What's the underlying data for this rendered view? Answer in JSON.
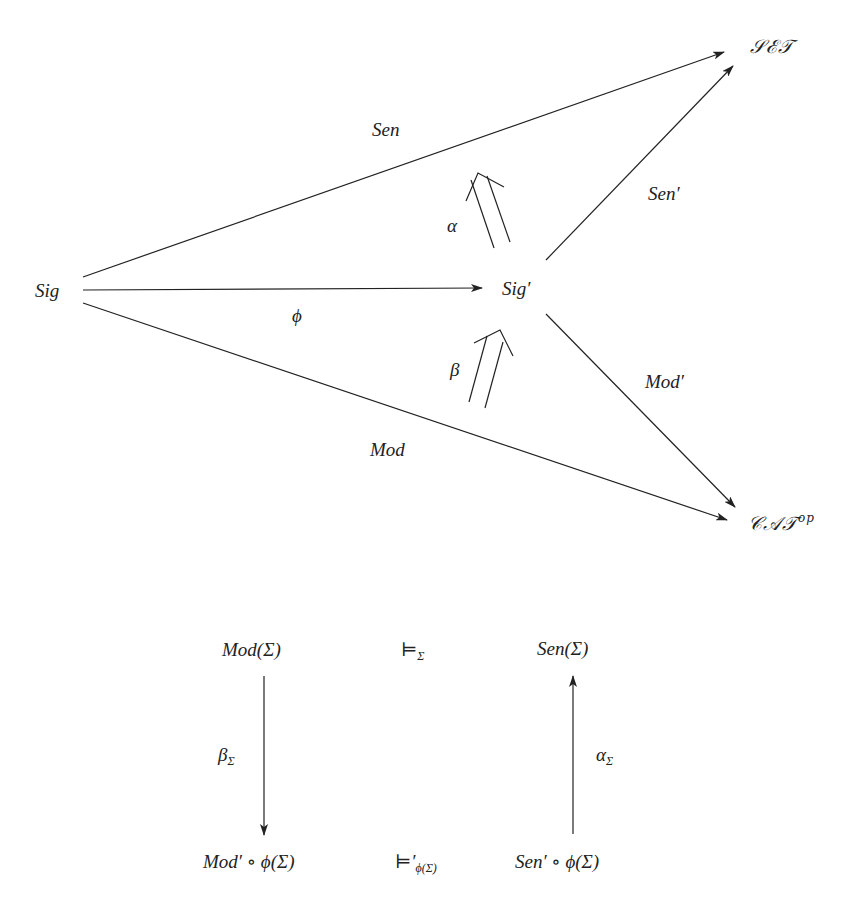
{
  "top_diagram": {
    "nodes": {
      "sig": "Sig",
      "sig_prime": "Sig′",
      "set": "𝒮ℰ𝒯",
      "cat": "𝒞𝒜𝒯",
      "cat_sup": "op"
    },
    "edges": {
      "sen": "Sen",
      "sen_prime": "Sen′",
      "phi": "ϕ",
      "mod": "Mod",
      "mod_prime": "Mod′",
      "alpha": "α",
      "beta": "β"
    }
  },
  "bottom_diagram": {
    "mod_sigma": "Mod(Σ)",
    "sen_sigma": "Sen(Σ)",
    "models_sigma": "⊨",
    "models_sigma_sub": "Σ",
    "beta_sigma": "β",
    "beta_sigma_sub": "Σ",
    "alpha_sigma": "α",
    "alpha_sigma_sub": "Σ",
    "mod_prime_phi": "Mod′ ∘ ϕ(Σ)",
    "models_prime": "⊨′",
    "models_prime_sub": "ϕ(Σ)",
    "sen_prime_phi": "Sen′ ∘ ϕ(Σ)"
  },
  "colors": {
    "stroke": "#222222",
    "background": "#ffffff"
  }
}
